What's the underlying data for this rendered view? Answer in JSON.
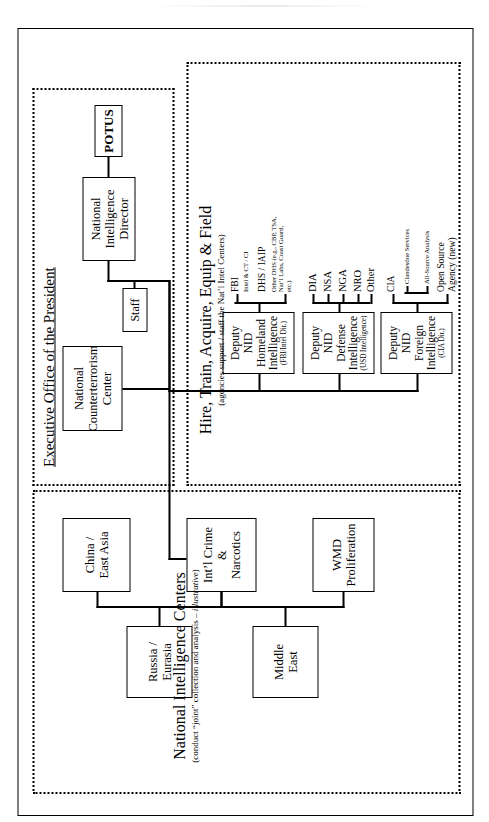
{
  "document": {
    "title": "Proposed U.S. Intelligence Community Reorganization Chart",
    "orientation": "rotated-90-ccw"
  },
  "executive_office": {
    "label": "Executive Office of the President",
    "potus": "POTUS",
    "nid": "National Intelligence\nDirector",
    "nid_line1": "National Intelligence",
    "nid_line2": "Director",
    "staff": "Staff",
    "nctc_line1": "National",
    "nctc_line2": "Counterterrorism",
    "nctc_line3": "Center"
  },
  "national_intelligence_centers": {
    "title": "National Intelligence Centers",
    "subtitle_pre": "(conduct “joint” collection and analysis – ",
    "subtitle_italic": "illustrative",
    "subtitle_post": ")",
    "centers_primary": [
      {
        "line1": "WMD",
        "line2": "Proliferation"
      },
      {
        "line1": "Int’l Crime",
        "line2": "&",
        "line3": "Narcotics"
      },
      {
        "line1": "China /",
        "line2": "East Asia"
      }
    ],
    "centers_secondary": [
      {
        "line1": "Middle",
        "line2": "East"
      },
      {
        "line1": "Russia /",
        "line2": "Eurasia"
      }
    ]
  },
  "agencies_section": {
    "title": "Hire, Train, Acquire, Equip & Field",
    "subtitle": "(agencies support / staff the Nat’l Intel Centers)",
    "deputies": [
      {
        "line1": "Deputy NID",
        "line2": "Foreign",
        "line3": "Intelligence",
        "sub": "(CIA Dir.)",
        "children": [
          {
            "label": "CIA",
            "size": "mid",
            "grandchildren": [
              {
                "label": "Clandestine Services"
              },
              {
                "label": "All-Source Analysis"
              }
            ]
          },
          {
            "label": "Open Source",
            "label2": "Agency (new)",
            "size": "mid"
          }
        ]
      },
      {
        "line1": "Deputy NID",
        "line2": "Defense",
        "line3": "Intelligence",
        "sub": "(USD Intelligence)",
        "children": [
          {
            "label": "DIA"
          },
          {
            "label": "NSA"
          },
          {
            "label": "NGA"
          },
          {
            "label": "NRO"
          },
          {
            "label": "Other"
          }
        ]
      },
      {
        "line1": "Deputy NID",
        "line2": "Homeland",
        "line3": "Intelligence",
        "sub": "(FBI/Intel Dir.)",
        "children": [
          {
            "label": "FBI",
            "detail": "Intel & CT / CI"
          },
          {
            "label": "DHS / IAIP",
            "detail": "Other DHS (e.g., CBP, TSA, Nat’l Labs, Coast Guard, etc.)"
          }
        ]
      }
    ]
  }
}
